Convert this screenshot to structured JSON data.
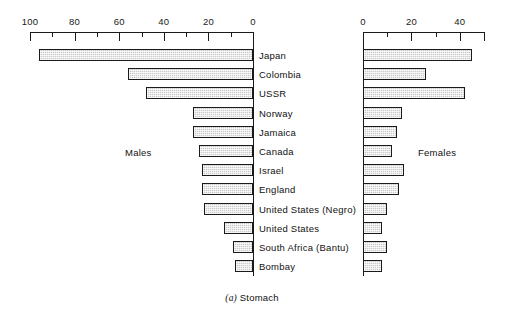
{
  "figure": {
    "caption_index": "(a)",
    "caption_text": "Stomach"
  },
  "panels": {
    "males": {
      "title": "Males",
      "axis": {
        "labels": [
          "100",
          "80",
          "60",
          "40",
          "20",
          "0"
        ],
        "label_values": [
          100,
          80,
          60,
          40,
          20,
          0
        ],
        "minor_values": [
          90,
          70,
          50,
          30,
          10
        ],
        "min": 0,
        "max": 100,
        "direction": "right-to-left"
      }
    },
    "females": {
      "title": "Females",
      "axis": {
        "labels": [
          "0",
          "20",
          "40"
        ],
        "label_values": [
          0,
          20,
          40
        ],
        "minor_values": [
          10,
          30,
          50
        ],
        "min": 0,
        "max": 52,
        "direction": "left-to-right"
      }
    }
  },
  "categories": [
    "Japan",
    "Colombia",
    "USSR",
    "Norway",
    "Jamaica",
    "Canada",
    "Israel",
    "England",
    "United States (Negro)",
    "United States",
    "South Africa (Bantu)",
    "Bombay"
  ],
  "chart_data": {
    "type": "bar",
    "orientation": "horizontal",
    "layout": "back-to-back population pyramid, category labels centered between panels",
    "grid": false,
    "legend": "none",
    "categories": [
      "Japan",
      "Colombia",
      "USSR",
      "Norway",
      "Jamaica",
      "Canada",
      "Israel",
      "England",
      "United States (Negro)",
      "United States",
      "South Africa (Bantu)",
      "Bombay"
    ],
    "series": [
      {
        "name": "Males",
        "panel": "left",
        "xlabel": "",
        "ylabel": "",
        "xlim": [
          0,
          100
        ],
        "axis_ticks_major": [
          0,
          20,
          40,
          60,
          80,
          100
        ],
        "axis_ticks_minor": [
          10,
          30,
          50,
          70,
          90
        ],
        "values": [
          96,
          56,
          48,
          27,
          27,
          24,
          23,
          23,
          22,
          13,
          9,
          8
        ]
      },
      {
        "name": "Females",
        "panel": "right",
        "xlabel": "",
        "ylabel": "",
        "xlim": [
          0,
          52
        ],
        "axis_ticks_major": [
          0,
          20,
          40
        ],
        "axis_ticks_minor": [
          10,
          30,
          50
        ],
        "values": [
          45,
          26,
          42,
          16,
          14,
          12,
          17,
          15,
          10,
          8,
          10,
          8
        ]
      }
    ]
  },
  "colors": {
    "bar_fill": "#c9c9c9",
    "bar_border": "#1a1a1a",
    "axis": "#1a1a1a",
    "text": "#111111",
    "background": "#ffffff"
  }
}
